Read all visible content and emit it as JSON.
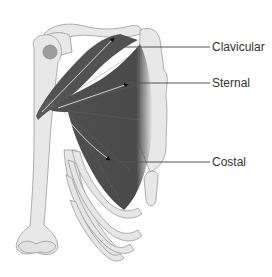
{
  "diagram": {
    "labels": [
      {
        "id": "clavicular",
        "text": "Clavicular",
        "x": 212,
        "y": 40,
        "line_from": [
          117,
          47
        ],
        "line_to": [
          210,
          47
        ]
      },
      {
        "id": "sternal",
        "text": "Sternal",
        "x": 212,
        "y": 76,
        "line_from": [
          125,
          83
        ],
        "line_to": [
          210,
          83
        ]
      },
      {
        "id": "costal",
        "text": "Costal",
        "x": 212,
        "y": 155,
        "line_from": [
          115,
          162
        ],
        "line_to": [
          210,
          162
        ]
      }
    ],
    "colors": {
      "muscle": "#505050",
      "bone_fill": "#e8e8e8",
      "bone_stroke": "#9a9a9a",
      "leader_line": "#555555",
      "label_text": "#333333",
      "humeral_head": "#9c9c9c"
    }
  }
}
